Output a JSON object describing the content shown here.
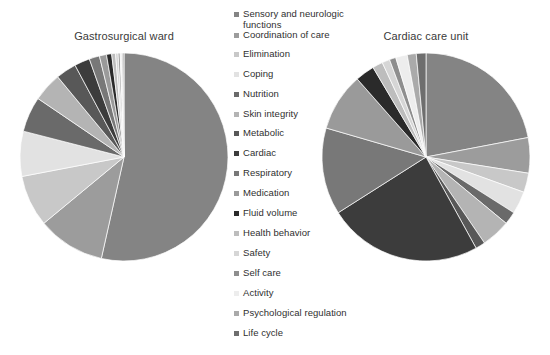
{
  "chart_data": [
    {
      "type": "pie",
      "title": "Gastrosurgical ward",
      "categories": [
        "Sensory and neurologic functions",
        "Coordination of care",
        "Elimination",
        "Coping",
        "Nutrition",
        "Skin integrity",
        "Metabolic",
        "Cardiac",
        "Respiratory",
        "Medication",
        "Fluid volume",
        "Health behavior",
        "Safety",
        "Self care",
        "Activity",
        "Psychological regulation",
        "Life cycle"
      ],
      "values": [
        53.5,
        10.5,
        8.0,
        7.0,
        5.5,
        4.5,
        3.2,
        2.4,
        1.6,
        1.1,
        0.8,
        0.6,
        0.4,
        0.3,
        0.25,
        0.2,
        0.15
      ],
      "units": "percent",
      "start_angle": 0,
      "direction": "clockwise",
      "legend_position": "center"
    },
    {
      "type": "pie",
      "title": "Cardiac care unit",
      "categories": [
        "Sensory and neurologic functions",
        "Coordination of care",
        "Elimination",
        "Coping",
        "Nutrition",
        "Skin integrity",
        "Metabolic",
        "Cardiac",
        "Respiratory",
        "Medication",
        "Fluid volume",
        "Health behavior",
        "Safety",
        "Self care",
        "Activity",
        "Psychological regulation",
        "Life cycle"
      ],
      "values": [
        22.0,
        5.5,
        3.0,
        3.5,
        2.0,
        4.5,
        1.5,
        24.0,
        13.5,
        9.0,
        3.0,
        1.6,
        1.2,
        1.0,
        1.8,
        1.4,
        1.5
      ],
      "units": "percent",
      "start_angle": 0,
      "direction": "clockwise",
      "legend_position": "center"
    }
  ],
  "charts": {
    "left": {
      "title": "Gastrosurgical ward",
      "slices": [
        {
          "label": "Sensory and neurologic functions",
          "value": 53.5,
          "color": "#848484"
        },
        {
          "label": "Coordination of care",
          "value": 10.5,
          "color": "#9c9c9c"
        },
        {
          "label": "Elimination",
          "value": 8.0,
          "color": "#c8c8c8"
        },
        {
          "label": "Coping",
          "value": 7.0,
          "color": "#e2e2e2"
        },
        {
          "label": "Nutrition",
          "value": 5.5,
          "color": "#6a6a6a"
        },
        {
          "label": "Skin integrity",
          "value": 4.5,
          "color": "#b4b4b4"
        },
        {
          "label": "Metabolic",
          "value": 3.2,
          "color": "#585858"
        },
        {
          "label": "Cardiac",
          "value": 2.4,
          "color": "#3c3c3c"
        },
        {
          "label": "Respiratory",
          "value": 1.6,
          "color": "#787878"
        },
        {
          "label": "Medication",
          "value": 1.1,
          "color": "#9a9a9a"
        },
        {
          "label": "Fluid volume",
          "value": 0.8,
          "color": "#2a2a2a"
        },
        {
          "label": "Health behavior",
          "value": 0.6,
          "color": "#bdbdbd"
        },
        {
          "label": "Safety",
          "value": 0.4,
          "color": "#d6d6d6"
        },
        {
          "label": "Self care",
          "value": 0.3,
          "color": "#8e8e8e"
        },
        {
          "label": "Activity",
          "value": 0.25,
          "color": "#ededed"
        },
        {
          "label": "Psychological regulation",
          "value": 0.2,
          "color": "#aaaaaa"
        },
        {
          "label": "Life cycle",
          "value": 0.15,
          "color": "#6e6e6e"
        }
      ]
    },
    "right": {
      "title": "Cardiac care unit",
      "slices": [
        {
          "label": "Sensory and neurologic functions",
          "value": 22.0,
          "color": "#848484"
        },
        {
          "label": "Coordination of care",
          "value": 5.5,
          "color": "#9c9c9c"
        },
        {
          "label": "Elimination",
          "value": 3.0,
          "color": "#c8c8c8"
        },
        {
          "label": "Coping",
          "value": 3.5,
          "color": "#e2e2e2"
        },
        {
          "label": "Nutrition",
          "value": 2.0,
          "color": "#6a6a6a"
        },
        {
          "label": "Skin integrity",
          "value": 4.5,
          "color": "#b4b4b4"
        },
        {
          "label": "Metabolic",
          "value": 1.5,
          "color": "#585858"
        },
        {
          "label": "Cardiac",
          "value": 24.0,
          "color": "#3c3c3c"
        },
        {
          "label": "Respiratory",
          "value": 13.5,
          "color": "#787878"
        },
        {
          "label": "Medication",
          "value": 9.0,
          "color": "#9a9a9a"
        },
        {
          "label": "Fluid volume",
          "value": 3.0,
          "color": "#2a2a2a"
        },
        {
          "label": "Health behavior",
          "value": 1.6,
          "color": "#bdbdbd"
        },
        {
          "label": "Safety",
          "value": 1.2,
          "color": "#d6d6d6"
        },
        {
          "label": "Self care",
          "value": 1.0,
          "color": "#8e8e8e"
        },
        {
          "label": "Activity",
          "value": 1.8,
          "color": "#ededed"
        },
        {
          "label": "Psychological regulation",
          "value": 1.4,
          "color": "#aaaaaa"
        },
        {
          "label": "Life cycle",
          "value": 1.5,
          "color": "#6e6e6e"
        }
      ]
    }
  },
  "legend": {
    "items": [
      {
        "label": "Sensory and neurologic\nfunctions",
        "color": "#848484",
        "y": 6
      },
      {
        "label": "Coordination of care",
        "color": "#9c9c9c",
        "y": 27
      },
      {
        "label": "Elimination",
        "color": "#c8c8c8",
        "y": 46
      },
      {
        "label": "Coping",
        "color": "#e2e2e2",
        "y": 66
      },
      {
        "label": "Nutrition",
        "color": "#6a6a6a",
        "y": 86
      },
      {
        "label": "Skin integrity",
        "color": "#b4b4b4",
        "y": 106
      },
      {
        "label": "Metabolic",
        "color": "#585858",
        "y": 125
      },
      {
        "label": "Cardiac",
        "color": "#3c3c3c",
        "y": 145
      },
      {
        "label": "Respiratory",
        "color": "#787878",
        "y": 165
      },
      {
        "label": "Medication",
        "color": "#9a9a9a",
        "y": 185
      },
      {
        "label": "Fluid volume",
        "color": "#2a2a2a",
        "y": 205
      },
      {
        "label": "Health behavior",
        "color": "#bdbdbd",
        "y": 225
      },
      {
        "label": "Safety",
        "color": "#d6d6d6",
        "y": 245
      },
      {
        "label": "Self care",
        "color": "#8e8e8e",
        "y": 265
      },
      {
        "label": "Activity",
        "color": "#ededed",
        "y": 285
      },
      {
        "label": "Psychological regulation",
        "color": "#aaaaaa",
        "y": 305
      },
      {
        "label": "Life cycle",
        "color": "#6e6e6e",
        "y": 325
      }
    ]
  }
}
